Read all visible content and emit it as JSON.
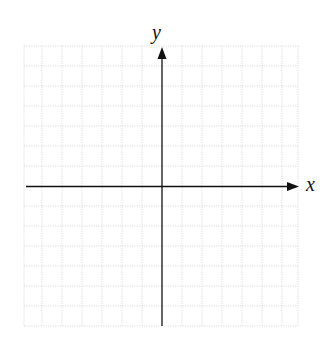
{
  "diagram": {
    "type": "cartesian-coordinate-grid",
    "axes": {
      "x": {
        "label": "x",
        "direction": "right",
        "arrow": true
      },
      "y": {
        "label": "y",
        "direction": "up",
        "arrow": true
      }
    },
    "grid": {
      "columns": 14,
      "rows": 14,
      "style": "dotted",
      "color": "#d4d4d4"
    },
    "colors": {
      "axis": "#111111",
      "background": "#ffffff"
    }
  }
}
